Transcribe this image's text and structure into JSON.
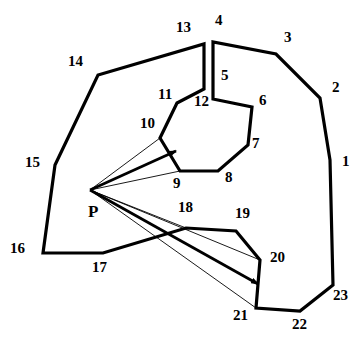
{
  "diagram": {
    "viewpoint_label": "P",
    "vertex_labels": [
      "1",
      "2",
      "3",
      "4",
      "5",
      "6",
      "7",
      "8",
      "9",
      "10",
      "11",
      "12",
      "13",
      "14",
      "15",
      "16",
      "17",
      "18",
      "19",
      "20",
      "21",
      "22",
      "23"
    ],
    "rays": [
      {
        "from": "P",
        "to": "10",
        "style": "thin"
      },
      {
        "from": "P",
        "to": "9",
        "style": "thin"
      },
      {
        "from": "P",
        "to": "edge 9-10",
        "style": "arrow"
      },
      {
        "from": "P",
        "to": "18",
        "style": "thin"
      },
      {
        "from": "P",
        "to": "20",
        "style": "thin"
      },
      {
        "from": "P",
        "to": "21",
        "style": "thin"
      },
      {
        "from": "P",
        "to": "edge 20-21",
        "style": "arrow"
      }
    ],
    "color": "#000000"
  }
}
